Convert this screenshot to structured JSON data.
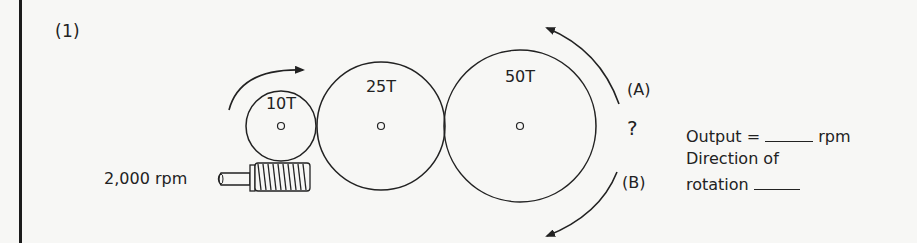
{
  "problem": {
    "number": "(1)",
    "input_speed": "2,000 rpm",
    "gears": [
      {
        "label": "10T",
        "teeth": 10
      },
      {
        "label": "25T",
        "teeth": 25
      },
      {
        "label": "50T",
        "teeth": 50
      }
    ],
    "direction_options": {
      "a": "(A)",
      "b": "(B)"
    },
    "unknown_marker": "?",
    "output_prefix": "Output =",
    "output_unit": "rpm",
    "direction_line1": "Direction of",
    "direction_line2": "rotation"
  },
  "colors": {
    "ink": "#222222",
    "paper": "#f7f7f5"
  }
}
